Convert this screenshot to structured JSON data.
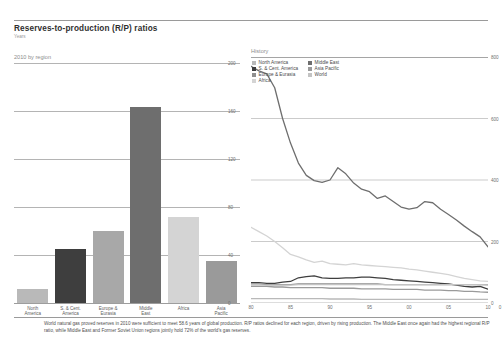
{
  "header": {
    "title": "Reserves-to-production (R/P) ratios",
    "subtitle": "Years"
  },
  "left_panel": {
    "label": "2010 by region"
  },
  "right_panel": {
    "label": "History"
  },
  "colors": {
    "north_america": "#b9b9b9",
    "s_cent_america": "#3e3e3e",
    "europe_eurasia": "#a8a8a8",
    "middle_east": "#6e6e6e",
    "africa": "#d4d4d4",
    "asia_pacific": "#9a9a9a",
    "world": "#c3c3c3",
    "gridline": "#9d9d9d",
    "text": "#4a4a4a"
  },
  "legend": {
    "columns": [
      [
        {
          "label": "North America",
          "color": "#b9b9b9"
        },
        {
          "label": "S. & Cent. America",
          "color": "#3e3e3e"
        },
        {
          "label": "Europe & Eurasia",
          "color": "#8f8f8f"
        },
        {
          "label": "Africa",
          "color": "#d4d4d4"
        }
      ],
      [
        {
          "label": "Middle East",
          "color": "#6e6e6e"
        },
        {
          "label": "Asia Pacific",
          "color": "#9a9a9a"
        },
        {
          "label": "World",
          "color": "#c3c3c3"
        }
      ]
    ]
  },
  "footnote": "World natural gas proved reserves in 2010 were sufficient to meet 58.6 years of global production. R/P ratios declined for each region, driven by rising production. The Middle East once again had the highest regional R/P ratio, while Middle East and Former Soviet Union regions jointly hold 72% of the world's gas reserves.",
  "chart_data": [
    {
      "type": "bar",
      "title": "2010 by region",
      "xlabel": "",
      "ylabel": "Years",
      "ylim": [
        0,
        200
      ],
      "yticks": [
        0,
        40,
        80,
        120,
        160,
        200
      ],
      "grid": true,
      "categories": [
        "North America",
        "S. & Cent. America",
        "Europe & Eurasia",
        "Middle East",
        "Africa",
        "Asia Pacific"
      ],
      "category_lines": [
        [
          "North",
          "America"
        ],
        [
          "S. & Cent.",
          "America"
        ],
        [
          "Europe &",
          "Eurasia"
        ],
        [
          "Middle",
          "East"
        ],
        [
          "Africa",
          ""
        ],
        [
          "Asia",
          "Pacific"
        ]
      ],
      "values": [
        12,
        45,
        60,
        163,
        72,
        35
      ],
      "colors": [
        "#b9b9b9",
        "#3e3e3e",
        "#a8a8a8",
        "#6e6e6e",
        "#d4d4d4",
        "#9a9a9a"
      ]
    },
    {
      "type": "line",
      "title": "History",
      "xlabel": "",
      "ylabel": "Years",
      "ylim": [
        0,
        800
      ],
      "yticks": [
        0,
        200,
        400,
        600,
        800
      ],
      "xlim": [
        1980,
        2010
      ],
      "xticks": [
        1980,
        1985,
        1990,
        1995,
        2000,
        2005,
        2010
      ],
      "xtick_labels": [
        "80",
        "85",
        "90",
        "95",
        "00",
        "05",
        "10"
      ],
      "grid": true,
      "legend_position": "top-left",
      "x": [
        1980,
        1981,
        1982,
        1983,
        1984,
        1985,
        1986,
        1987,
        1988,
        1989,
        1990,
        1991,
        1992,
        1993,
        1994,
        1995,
        1996,
        1997,
        1998,
        1999,
        2000,
        2001,
        2002,
        2003,
        2004,
        2005,
        2006,
        2007,
        2008,
        2009,
        2010
      ],
      "series": [
        {
          "name": "Middle East",
          "color": "#6e6e6e",
          "values": [
            770,
            755,
            745,
            700,
            600,
            520,
            455,
            415,
            398,
            392,
            400,
            440,
            420,
            390,
            370,
            362,
            340,
            348,
            330,
            312,
            305,
            310,
            330,
            326,
            305,
            288,
            270,
            250,
            232,
            215,
            183
          ]
        },
        {
          "name": "Africa",
          "color": "#d4d4d4",
          "values": [
            246,
            232,
            218,
            200,
            180,
            158,
            150,
            140,
            132,
            136,
            128,
            126,
            124,
            128,
            124,
            122,
            120,
            118,
            116,
            114,
            110,
            108,
            104,
            100,
            96,
            92,
            86,
            80,
            76,
            72,
            70
          ]
        },
        {
          "name": "S. & Cent. America",
          "color": "#3e3e3e",
          "values": [
            66,
            66,
            64,
            64,
            68,
            70,
            82,
            86,
            88,
            82,
            80,
            80,
            82,
            82,
            84,
            84,
            82,
            80,
            76,
            74,
            72,
            70,
            68,
            66,
            64,
            62,
            58,
            54,
            52,
            54,
            45
          ]
        },
        {
          "name": "Europe & Eurasia",
          "color": "#8f8f8f",
          "values": [
            62,
            62,
            60,
            60,
            60,
            60,
            62,
            62,
            62,
            62,
            62,
            62,
            62,
            62,
            62,
            62,
            62,
            60,
            60,
            60,
            60,
            60,
            60,
            60,
            60,
            60,
            60,
            60,
            60,
            60,
            60
          ]
        },
        {
          "name": "Asia Pacific",
          "color": "#9a9a9a",
          "values": [
            54,
            54,
            54,
            52,
            52,
            50,
            50,
            50,
            50,
            50,
            48,
            48,
            48,
            48,
            46,
            46,
            46,
            46,
            44,
            44,
            44,
            44,
            42,
            42,
            42,
            40,
            40,
            38,
            38,
            36,
            35
          ]
        },
        {
          "name": "World",
          "color": "#c3c3c3",
          "values": [
            58,
            58,
            58,
            58,
            58,
            58,
            60,
            60,
            60,
            60,
            60,
            60,
            60,
            60,
            60,
            60,
            60,
            60,
            60,
            60,
            60,
            60,
            60,
            60,
            60,
            60,
            60,
            60,
            60,
            60,
            58.6
          ]
        },
        {
          "name": "North America",
          "color": "#b9b9b9",
          "values": [
            14,
            14,
            14,
            14,
            14,
            14,
            14,
            14,
            14,
            14,
            13,
            13,
            13,
            13,
            12,
            12,
            12,
            12,
            12,
            12,
            12,
            12,
            12,
            12,
            12,
            12,
            12,
            12,
            12,
            12,
            12
          ]
        }
      ]
    }
  ]
}
